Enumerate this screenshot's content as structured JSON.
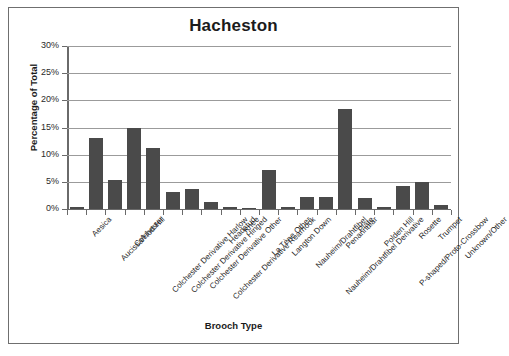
{
  "chart_data": {
    "type": "bar",
    "title": "Hacheston",
    "xlabel": "Brooch Type",
    "ylabel": "Percentage of Total",
    "ylim": [
      0,
      30
    ],
    "ytick_labels": [
      "30%",
      "25%",
      "20%",
      "15%",
      "10%",
      "5%",
      "0%"
    ],
    "ytick_values": [
      30,
      25,
      20,
      15,
      10,
      5,
      0
    ],
    "grid": true,
    "legend": false,
    "bar_color": "#4a4a4a",
    "categories": [
      "Aesica",
      "Aucissa/Hod Hill",
      "Colchester",
      "Colchester Derivative Harlow",
      "Colchester Derivative Hinged",
      "Colchester Derivative Other",
      "Colchester Derivative Rearhook",
      "Headstud",
      "Knee",
      "La Tène Other",
      "Langton Down",
      "Nauheim/Drahtfibel",
      "Nauheim/Drahtfibel Derivative",
      "Penannular",
      "Plate",
      "Polden Hill",
      "P-shaped/Proto-Crossbow",
      "Rosette",
      "Trumpet",
      "Unknown/Other"
    ],
    "values": [
      0.4,
      13.0,
      5.4,
      15.0,
      11.3,
      3.1,
      3.7,
      1.2,
      0.3,
      0.2,
      7.2,
      0.3,
      2.2,
      2.2,
      18.4,
      2.1,
      0.3,
      4.3,
      5.0,
      0.7
    ]
  }
}
